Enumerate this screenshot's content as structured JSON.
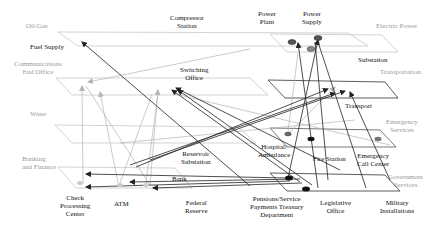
{
  "layers": [
    {
      "name": "Oil/Gas",
      "x": 26,
      "y": 22
    },
    {
      "name": "Electric Power",
      "x": 378,
      "y": 22
    },
    {
      "name": "Communications\nEnd Office",
      "x": 16,
      "y": 61
    },
    {
      "name": "Transportation",
      "x": 378,
      "y": 69
    },
    {
      "name": "Water",
      "x": 30,
      "y": 110
    },
    {
      "name": "Emergency\nServices",
      "x": 390,
      "y": 119
    },
    {
      "name": "Banking\nand Finance",
      "x": 22,
      "y": 155
    },
    {
      "name": "Government\nServices",
      "x": 395,
      "y": 173
    }
  ],
  "nodes": [
    {
      "name": "Compressor\nStation",
      "x": 186,
      "y": 14
    },
    {
      "name": "Power\nPlant",
      "x": 273,
      "y": 10
    },
    {
      "name": "Power\nSupply",
      "x": 315,
      "y": 10
    },
    {
      "name": "Fuel Supply",
      "x": 52,
      "y": 43
    },
    {
      "name": "Substation",
      "x": 375,
      "y": 56
    },
    {
      "name": "Switching\nOffice",
      "x": 195,
      "y": 67
    },
    {
      "name": "Transport",
      "x": 359,
      "y": 102
    },
    {
      "name": "Reservoir\nSubstation",
      "x": 198,
      "y": 150
    },
    {
      "name": "Hospital/\nAmbulance",
      "x": 275,
      "y": 144
    },
    {
      "name": "Fire Station",
      "x": 327,
      "y": 155
    },
    {
      "name": "Emergency\nCall Center",
      "x": 374,
      "y": 152
    },
    {
      "name": "Bank",
      "x": 183,
      "y": 175
    },
    {
      "name": "Check\nProcessing\nCenter",
      "x": 76,
      "y": 195
    },
    {
      "name": "ATM",
      "x": 122,
      "y": 200
    },
    {
      "name": "Federal\nReserve",
      "x": 200,
      "y": 200
    },
    {
      "name": "Pensions/Service\nPayments Treasury\nDepartment",
      "x": 273,
      "y": 196
    },
    {
      "name": "Legislative\nOffice",
      "x": 337,
      "y": 200
    },
    {
      "name": "Military\nInstallations",
      "x": 397,
      "y": 199
    }
  ],
  "colors": {
    "plane_outline": "#bdbdbd",
    "plane_outline_dark": "#333333",
    "arrow_dark": "#222222",
    "arrow_light": "#b5b5b5",
    "layer_label": "#9a9a9a",
    "node_label": "#111111"
  }
}
